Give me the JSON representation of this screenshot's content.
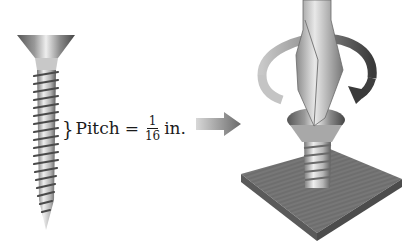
{
  "figure": {
    "label": {
      "brace": "}",
      "term": "Pitch",
      "equals": "=",
      "fraction": {
        "numerator": "1",
        "denominator": "16"
      },
      "unit": "in."
    },
    "left_illustration": "wood-screw-side-view",
    "arrow": "right-arrow",
    "right_illustration": "screwdriver-turning-screw-into-wood-block",
    "colors": {
      "metal_light": "#e6e6e6",
      "metal_dark": "#6e6e6e",
      "wood": "#6f6f6f",
      "wood_edge": "#4e4e4e",
      "arrow": "#7a7a7a",
      "text": "#1a1a1a"
    }
  }
}
